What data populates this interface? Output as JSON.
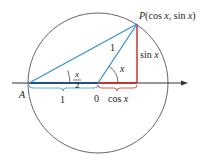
{
  "diagram": {
    "point_a_label": "A",
    "point_p_label": "P(cos x, sin x)",
    "origin_label": "0",
    "radius_label": "1",
    "segment_ao_label": "1",
    "cos_label": "cos x",
    "sin_label": "sin x",
    "angle_x_label": "x",
    "half_angle_numerator": "x",
    "half_angle_denominator": "2",
    "colors": {
      "blue": "#3a8fd0",
      "dark_blue": "#1f4f8a",
      "red": "#c0392b",
      "circle": "#555555",
      "axis": "#333333"
    }
  }
}
